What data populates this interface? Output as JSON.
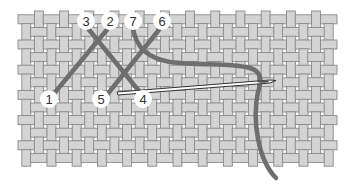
{
  "diagram": {
    "fabric": {
      "kind": "basket-weave canvas",
      "colors": {
        "thread_fill": "#d4d4d4",
        "thread_edge": "#8a8a8a",
        "hole": "#ffffff"
      }
    },
    "stitch_thread_color": "#6e6e6e",
    "needle": {
      "color": "#ffffff",
      "outline": "#333333"
    },
    "labels": [
      {
        "id": "1",
        "text": "1"
      },
      {
        "id": "2",
        "text": "2"
      },
      {
        "id": "3",
        "text": "3"
      },
      {
        "id": "4",
        "text": "4"
      },
      {
        "id": "5",
        "text": "5"
      },
      {
        "id": "6",
        "text": "6"
      },
      {
        "id": "7",
        "text": "7"
      }
    ]
  }
}
